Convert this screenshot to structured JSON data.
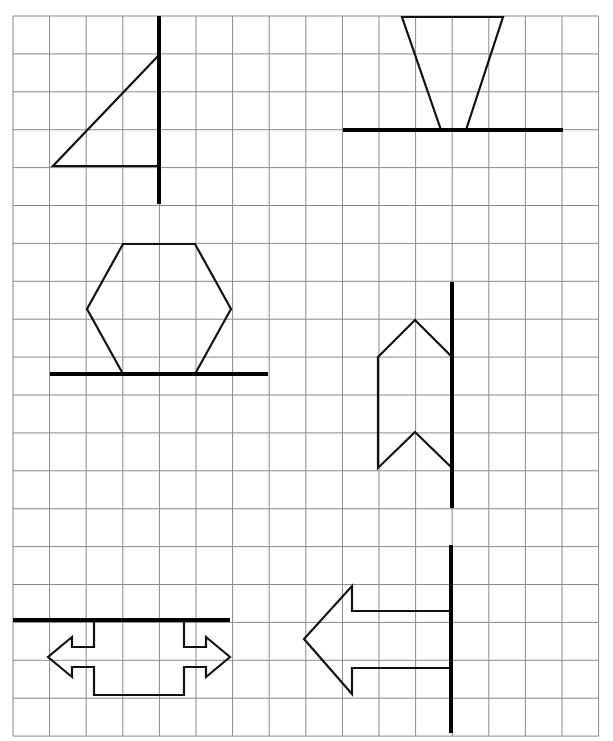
{
  "worksheet": {
    "grid": {
      "x0": 13,
      "y0": 16,
      "cols": 16,
      "rows": 19,
      "cell_w": 36.6,
      "cell_h": 37.9,
      "line_color": "#8a8a8a"
    },
    "figures": [
      {
        "id": "triangle",
        "mirror_line": [
          [
            159,
            16
          ],
          [
            159,
            204
          ]
        ],
        "shape_points": [
          [
            159,
            55
          ],
          [
            53,
            166
          ],
          [
            159,
            166
          ]
        ]
      },
      {
        "id": "trapezoid",
        "mirror_line": [
          [
            343,
            130
          ],
          [
            563,
            130
          ]
        ],
        "shape_points": [
          [
            402,
            17
          ],
          [
            503,
            17
          ],
          [
            466,
            130
          ],
          [
            441,
            130
          ]
        ]
      },
      {
        "id": "hexagon",
        "mirror_line": [
          [
            50,
            374
          ],
          [
            268,
            374
          ]
        ],
        "shape_points": [
          [
            123,
            244
          ],
          [
            195,
            244
          ],
          [
            231,
            309
          ],
          [
            195,
            374
          ],
          [
            123,
            374
          ],
          [
            87,
            309
          ]
        ]
      },
      {
        "id": "chevron",
        "mirror_line": [
          [
            452,
            282
          ],
          [
            452,
            508
          ]
        ],
        "shape_points": [
          [
            378,
            357
          ],
          [
            415,
            320
          ],
          [
            452,
            357
          ],
          [
            452,
            468
          ],
          [
            415,
            432
          ],
          [
            378,
            468
          ]
        ]
      },
      {
        "id": "double-arrow",
        "mirror_line": [
          [
            13,
            620
          ],
          [
            230,
            620
          ]
        ],
        "shape_points": [
          [
            94,
            620
          ],
          [
            94,
            647
          ],
          [
            72,
            647
          ],
          [
            72,
            637
          ],
          [
            48,
            657
          ],
          [
            72,
            677
          ],
          [
            72,
            667
          ],
          [
            94,
            667
          ],
          [
            94,
            695
          ],
          [
            184,
            695
          ],
          [
            184,
            667
          ],
          [
            206,
            667
          ],
          [
            206,
            677
          ],
          [
            230,
            657
          ],
          [
            206,
            637
          ],
          [
            206,
            647
          ],
          [
            184,
            647
          ],
          [
            184,
            620
          ]
        ]
      },
      {
        "id": "left-arrow",
        "mirror_line": [
          [
            451,
            545
          ],
          [
            451,
            733
          ]
        ],
        "shape_points": [
          [
            451,
            611
          ],
          [
            352,
            611
          ],
          [
            352,
            586
          ],
          [
            304,
            639
          ],
          [
            352,
            694
          ],
          [
            352,
            668
          ],
          [
            451,
            668
          ]
        ]
      }
    ]
  }
}
